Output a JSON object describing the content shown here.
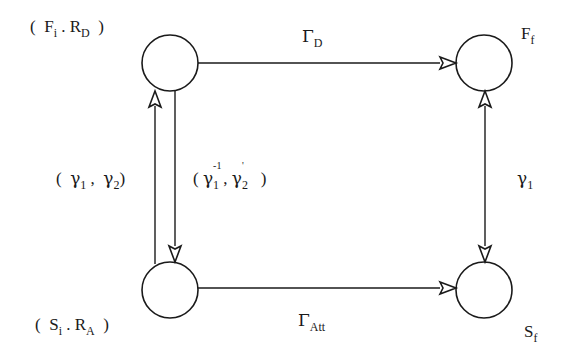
{
  "diagram": {
    "nodes": [
      {
        "id": "initial-top",
        "label_main_1": "F",
        "label_sub_1": "i",
        "label_sep": ".",
        "label_main_2": "R",
        "label_sub_2": "D",
        "open": "(",
        "close": ")"
      },
      {
        "id": "initial-bottom",
        "label_main_1": "S",
        "label_sub_1": "i",
        "label_sep": ".",
        "label_main_2": "R",
        "label_sub_2": "A",
        "open": "(",
        "close": ")"
      },
      {
        "id": "final-top",
        "label_main": "F",
        "label_sub": "f"
      },
      {
        "id": "final-bottom",
        "label_main": "S",
        "label_sub": "f"
      }
    ],
    "edges": [
      {
        "id": "top-horizontal",
        "label_main": "Γ",
        "label_sub": "D"
      },
      {
        "id": "bottom-horizontal",
        "label_main": "Γ",
        "label_sub": "Att"
      },
      {
        "id": "left-up",
        "open": "(",
        "g1": "γ",
        "g1_sub": "1",
        "sep": ",",
        "g2": "γ",
        "g2_sub": "2",
        "close": ")"
      },
      {
        "id": "left-down",
        "open": "(",
        "g1": "γ",
        "g1_sup": "-1",
        "g1_sub": "1",
        "sep": ",",
        "g2": "γ",
        "g2_sup": "'",
        "g2_sub": "2",
        "close": ")"
      },
      {
        "id": "right-bidirectional",
        "label_main": "γ",
        "label_sub": "1"
      }
    ],
    "stroke_color": "#1a1a1a",
    "background": "#ffffff"
  }
}
